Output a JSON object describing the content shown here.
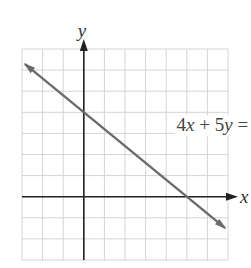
{
  "chart_data": {
    "type": "line",
    "title": "",
    "equation": "4x + 5y = 20",
    "xlabel": "x",
    "ylabel": "y",
    "xlim": [
      -3,
      7
    ],
    "ylim": [
      -3,
      7
    ],
    "grid": true,
    "grid_step": 1,
    "tick_labels": false,
    "series": [
      {
        "name": "4x + 5y = 20",
        "x": [
          -3,
          0,
          5,
          7
        ],
        "y": [
          6.4,
          4,
          0,
          -1.6
        ],
        "arrows": "both",
        "intercepts": {
          "x_intercept": [
            5,
            0
          ],
          "y_intercept": [
            0,
            4
          ]
        }
      }
    ],
    "annotations": [
      {
        "text": "4x + 5y = 20",
        "x": 4.7,
        "y": 3.2
      }
    ]
  },
  "labels": {
    "x_axis": "x",
    "y_axis": "y",
    "equation_parts": [
      "4",
      "x",
      " + 5",
      "y",
      " = 20"
    ]
  },
  "colors": {
    "grid": "#d4d4d4",
    "axis": "#222222",
    "line": "#6b6b6b",
    "text": "#444444"
  }
}
